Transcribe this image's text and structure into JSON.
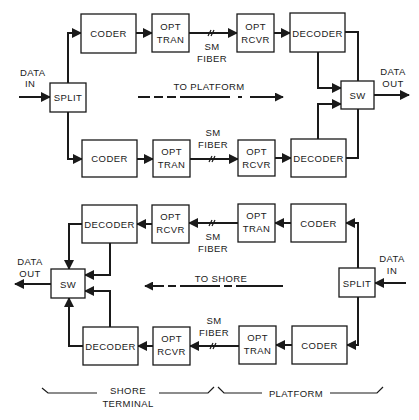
{
  "diagram": {
    "colors": {
      "line": "#1a1a1a",
      "background": "#ffffff"
    },
    "upper_link": {
      "direction_label": "TO PLATFORM",
      "input_label_1": "DATA",
      "input_label_2": "IN",
      "output_label_1": "DATA",
      "output_label_2": "OUT",
      "split": "SPLIT",
      "switch": "SW",
      "paths": [
        {
          "coder": "CODER",
          "transmitter_1": "OPT",
          "transmitter_2": "TRAN",
          "fiber_1": "SM",
          "fiber_2": "FIBER",
          "receiver_1": "OPT",
          "receiver_2": "RCVR",
          "decoder": "DECODER"
        },
        {
          "coder": "CODER",
          "transmitter_1": "OPT",
          "transmitter_2": "TRAN",
          "fiber_1": "SM",
          "fiber_2": "FIBER",
          "receiver_1": "OPT",
          "receiver_2": "RCVR",
          "decoder": "DECODER"
        }
      ]
    },
    "lower_link": {
      "direction_label": "TO SHORE",
      "input_label_1": "DATA",
      "input_label_2": "IN",
      "output_label_1": "DATA",
      "output_label_2": "OUT",
      "split": "SPLIT",
      "switch": "SW",
      "paths": [
        {
          "decoder": "DECODER",
          "receiver_1": "OPT",
          "receiver_2": "RCVR",
          "fiber_1": "SM",
          "fiber_2": "FIBER",
          "transmitter_1": "OPT",
          "transmitter_2": "TRAN",
          "coder": "CODER"
        },
        {
          "decoder": "DECODER",
          "receiver_1": "OPT",
          "receiver_2": "RCVR",
          "fiber_1": "SM",
          "fiber_2": "FIBER",
          "transmitter_1": "OPT",
          "transmitter_2": "TRAN",
          "coder": "CODER"
        }
      ]
    },
    "sections": {
      "shore_1": "SHORE",
      "shore_2": "TERMINAL",
      "platform": "PLATFORM"
    }
  }
}
